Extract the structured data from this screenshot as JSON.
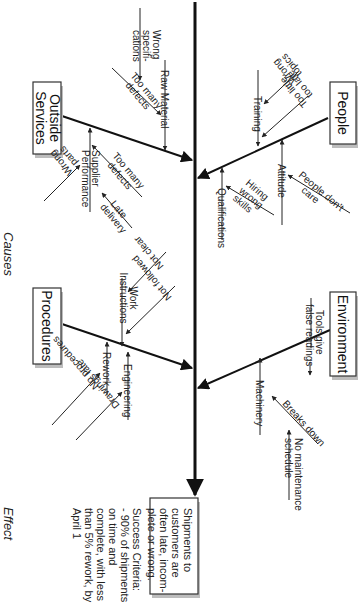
{
  "diagram": {
    "type": "fishbone",
    "orientation": "rotated-90-clockwise",
    "side_labels": {
      "causes": "Causes",
      "effect": "Effect"
    },
    "categories": {
      "outside_services": {
        "label": "Outside Services",
        "line1": "Outside",
        "line2": "Services",
        "causes": {
          "raw_material": "Raw Material",
          "wrong_specifications_l1": "Wrong",
          "wrong_specifications_l2": "specifi-",
          "wrong_specifications_l3": "cations",
          "too_many_defects_rm_l1": "Too many",
          "too_many_defects_rm_l2": "defects",
          "supplier_performance_l1": "Supplier",
          "supplier_performance_l2": "Performance",
          "too_many_defects_sp_l1": "Too many",
          "too_many_defects_sp_l2": "defects",
          "late_delivery_l1": "Late",
          "late_delivery_l2": "delivery",
          "wrong_parts_l1": "Wrong",
          "wrong_parts_l2": "parts"
        }
      },
      "people": {
        "label": "People",
        "causes": {
          "training": "Training",
          "wrong_topics_l1": "Wrong",
          "wrong_topics_l2": "topics",
          "too_little_l1": "Too little,",
          "too_little_l2": "too late",
          "attitude": "Attitude",
          "people_dont_care_l1": "People don't",
          "people_dont_care_l2": "care",
          "qualifications": "Qualifications",
          "hiring_l1": "Hiring",
          "hiring_l2": "wrong",
          "hiring_l3": "skills"
        }
      },
      "procedures": {
        "label": "Procedures",
        "causes": {
          "work_instructions_l1": "Work",
          "work_instructions_l2": "Instructions",
          "not_clear": "Not clear",
          "not_followed": "Not followed",
          "rework": "Rework",
          "no_procedures": "No procedures",
          "engineering": "Engineering",
          "drawings_late": "Drawings late"
        }
      },
      "environment": {
        "label": "Environment",
        "causes": {
          "tools_l1": "Tools give",
          "tools_l2": "false readings",
          "machinery": "Machinery",
          "breaks_down": "Breaks down",
          "no_maint_l1": "No maintenance",
          "no_maint_l2": "schedule"
        }
      }
    },
    "effect": {
      "problem_l1": "Shipments to",
      "problem_l2": "customers are",
      "problem_l3": "often late, incom-",
      "problem_l4": "plete or wrong.",
      "criteria_l1": "Success Criteria:",
      "criteria_l2": "- 90% of shipments",
      "criteria_l3": "on time and",
      "criteria_l4": "complete, with less",
      "criteria_l5": "than 5% rework, by",
      "criteria_l6": "April 1"
    }
  }
}
